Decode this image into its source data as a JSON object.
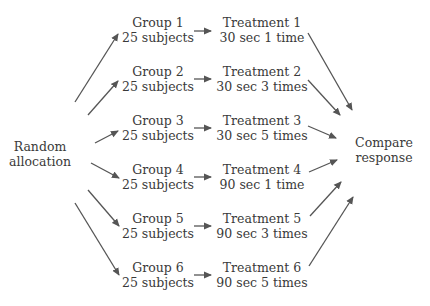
{
  "source": {
    "line1": "Random",
    "line2": "allocation"
  },
  "sink": {
    "line1": "Compare",
    "line2": "response"
  },
  "groups": [
    {
      "label": "Group 1",
      "size": "25 subjects"
    },
    {
      "label": "Group 2",
      "size": "25 subjects"
    },
    {
      "label": "Group 3",
      "size": "25 subjects"
    },
    {
      "label": "Group 4",
      "size": "25 subjects"
    },
    {
      "label": "Group 5",
      "size": "25 subjects"
    },
    {
      "label": "Group 6",
      "size": "25 subjects"
    }
  ],
  "treatments": [
    {
      "label": "Treatment 1",
      "detail": "30 sec 1 time"
    },
    {
      "label": "Treatment 2",
      "detail": "30 sec 3 times"
    },
    {
      "label": "Treatment 3",
      "detail": "30 sec 5 times"
    },
    {
      "label": "Treatment 4",
      "detail": "90 sec 1 time"
    },
    {
      "label": "Treatment 5",
      "detail": "90 sec 3 times"
    },
    {
      "label": "Treatment 6",
      "detail": "90 sec 5 times"
    }
  ],
  "colors": {
    "text": "#3a3a3a",
    "arrow": "#555555",
    "background": "#ffffff"
  }
}
